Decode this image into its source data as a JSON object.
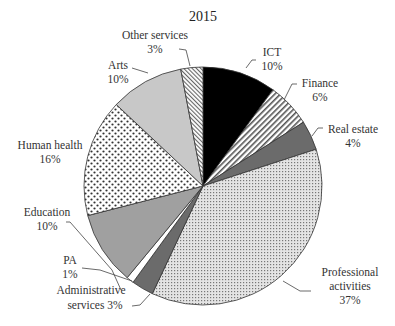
{
  "chart_data": {
    "type": "pie",
    "title": "2015",
    "start_angle_deg": 0,
    "direction": "clockwise",
    "slices": [
      {
        "label": "ICT",
        "value": 10,
        "pct_label": "10%",
        "fill": "#000000",
        "pattern": "solid"
      },
      {
        "label": "Finance",
        "value": 6,
        "pct_label": "6%",
        "fill": "#ffffff",
        "pattern": "diagonal-stripes"
      },
      {
        "label": "Real estate",
        "value": 4,
        "pct_label": "4%",
        "fill": "#6b6b6b",
        "pattern": "solid"
      },
      {
        "label": "Professional activities",
        "value": 37,
        "pct_label": "37%",
        "fill": "#d8d8d8",
        "pattern": "fine-dots"
      },
      {
        "label": "Administrative services",
        "value": 3,
        "pct_label": "3%",
        "fill": "#6b6b6b",
        "pattern": "solid"
      },
      {
        "label": "PA",
        "value": 1,
        "pct_label": "1%",
        "fill": "#ffffff",
        "pattern": "solid"
      },
      {
        "label": "Education",
        "value": 10,
        "pct_label": "10%",
        "fill": "#a0a0a0",
        "pattern": "solid"
      },
      {
        "label": "Human health",
        "value": 16,
        "pct_label": "16%",
        "fill": "#ffffff",
        "pattern": "coarse-dots"
      },
      {
        "label": "Arts",
        "value": 10,
        "pct_label": "10%",
        "fill": "#c8c8c8",
        "pattern": "solid"
      },
      {
        "label": "Other services",
        "value": 3,
        "pct_label": "3%",
        "fill": "#ffffff",
        "pattern": "fine-diagonal-stripes"
      }
    ],
    "legend": "none (callout labels)"
  },
  "labels": {
    "title": "2015",
    "ict": {
      "name": "ICT",
      "pct": "10%"
    },
    "finance": {
      "name": "Finance",
      "pct": "6%"
    },
    "real_estate": {
      "name": "Real estate",
      "pct": "4%"
    },
    "professional": {
      "line1": "Professional",
      "line2": "activities",
      "pct": "37%"
    },
    "admin": {
      "line1": "Administrative",
      "line2": "services 3%"
    },
    "pa": {
      "name": "PA",
      "pct": "1%"
    },
    "education": {
      "name": "Education",
      "pct": "10%"
    },
    "human_health": {
      "name": "Human health",
      "pct": "16%"
    },
    "arts": {
      "name": "Arts",
      "pct": "10%"
    },
    "other": {
      "name": "Other services",
      "pct": "3%"
    }
  }
}
